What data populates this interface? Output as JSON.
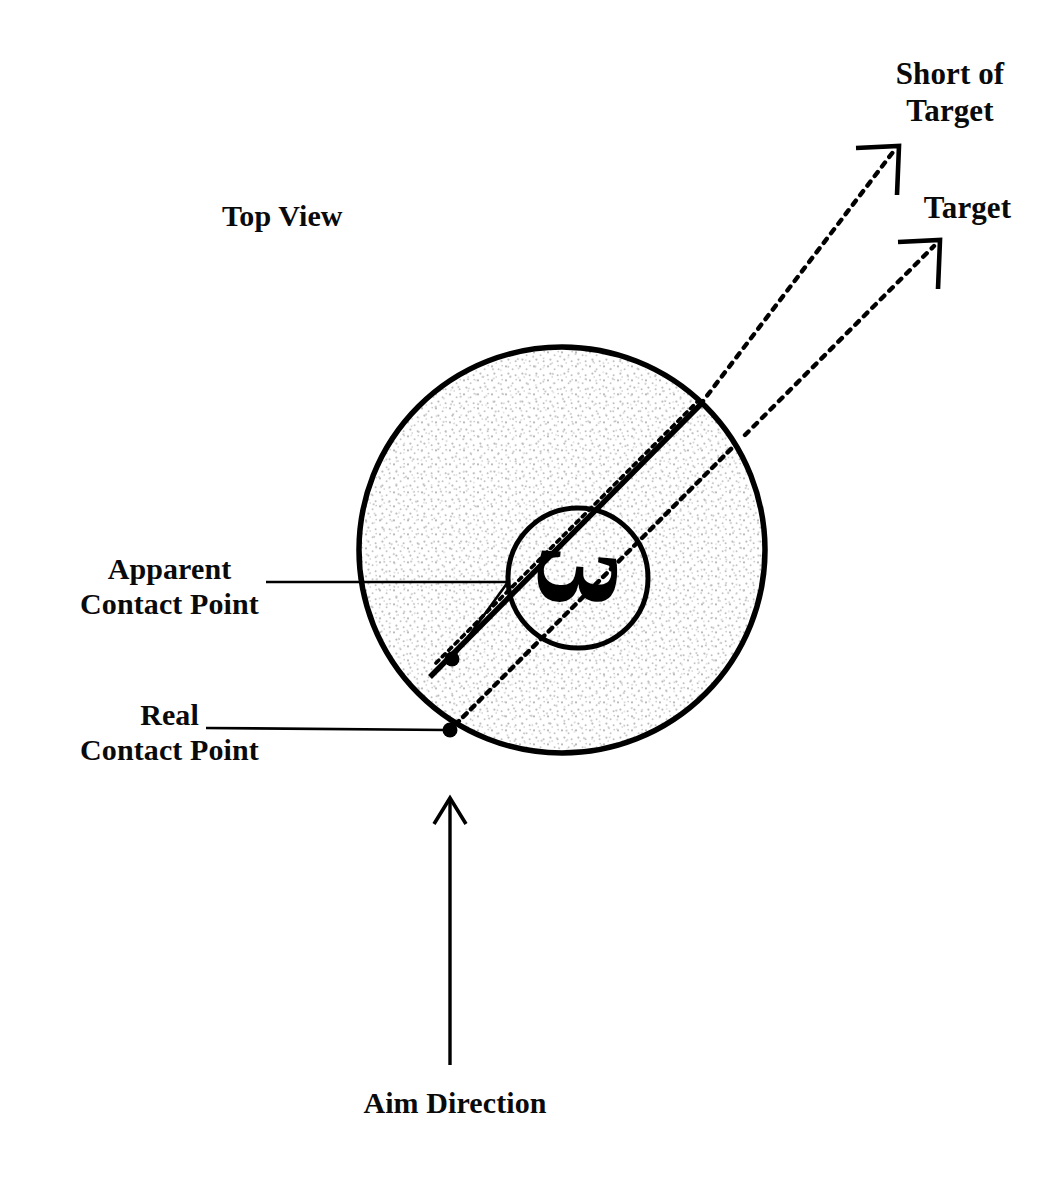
{
  "figure": {
    "kind": "billiards-cut-shot-diagram",
    "background_color": "#ffffff",
    "ink_color": "#000000",
    "ball_fill_pattern": "stipple",
    "ball_fill_color": "#efefef"
  },
  "labels": {
    "view": "Top View",
    "short_of_target": "Short of\nTarget",
    "target": "Target",
    "apparent_contact_point": "Apparent\nContact Point",
    "real_contact_point": "Real\nContact Point",
    "aim_direction": "Aim Direction"
  },
  "ball": {
    "number": "3",
    "center_x": 562,
    "center_y": 550,
    "radius": 204,
    "number_circle_center_x": 578,
    "number_circle_center_y": 578,
    "number_circle_radius": 70,
    "number_rotation_degrees": 95
  },
  "points": [
    {
      "name": "apparent-contact-point",
      "x": 452,
      "y": 659,
      "marker": "filled-dot",
      "radius": 7
    },
    {
      "name": "real-contact-point",
      "x": 450,
      "y": 730,
      "marker": "filled-dot",
      "radius": 7
    }
  ],
  "paths": {
    "short_of_target_line": {
      "style": "solid-then-dotted",
      "from_x": 452,
      "from_y": 659,
      "exit_x": 700,
      "exit_y": 405,
      "to_x": 893,
      "to_y": 152,
      "arrowhead": true
    },
    "short_of_target_ghost_line": {
      "style": "dotted",
      "from_x": 452,
      "from_y": 659,
      "to_x": 700,
      "to_y": 405
    },
    "target_line": {
      "style": "dotted",
      "from_x": 450,
      "from_y": 730,
      "to_x": 934,
      "to_y": 246,
      "arrowhead": true
    },
    "aim_direction_arrow": {
      "style": "solid",
      "from_x": 450,
      "from_y": 1065,
      "to_x": 450,
      "to_y": 799,
      "arrowhead": true
    },
    "apparent_leader": {
      "style": "solid",
      "segments": [
        [
          265,
          582
        ],
        [
          508,
          582
        ],
        [
          452,
          659
        ]
      ]
    },
    "real_leader": {
      "style": "solid",
      "segments": [
        [
          205,
          727
        ],
        [
          450,
          730
        ]
      ]
    }
  }
}
